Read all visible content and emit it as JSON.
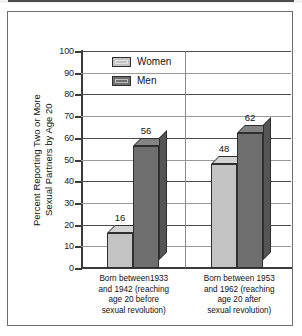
{
  "chart_data": {
    "type": "bar",
    "title": "",
    "xlabel": "",
    "ylabel_line1": "Percent Reporting Two or More",
    "ylabel_line2": "Sexual Partners by Age 20",
    "ylim": [
      0,
      100
    ],
    "ytick_step": 10,
    "yticks": [
      "100",
      "90",
      "80",
      "70",
      "60",
      "50",
      "40",
      "30",
      "20",
      "10",
      "0"
    ],
    "grid": true,
    "legend_position": "top-left-inside",
    "categories": [
      "Born between1933 and 1942 (reaching age 20 before sexual revolution)",
      "Born between 1953 and 1962 (reaching age 20 after sexual revolution)"
    ],
    "category_label_lines": [
      [
        "Born between1933",
        "and 1942 (reaching",
        "age 20 before",
        "sexual revolution)"
      ],
      [
        "Born between 1953",
        "and 1962 (reaching",
        "age 20 after",
        "sexual revolution)"
      ]
    ],
    "series": [
      {
        "name": "Women",
        "color": "#c3c3c3",
        "values": [
          16,
          48
        ]
      },
      {
        "name": "Men",
        "color": "#6f6f6f",
        "values": [
          56,
          62
        ]
      }
    ],
    "data_labels": [
      "16",
      "56",
      "48",
      "62"
    ]
  },
  "legend": {
    "items": [
      {
        "label": "Women",
        "color": "#c3c3c3"
      },
      {
        "label": "Men",
        "color": "#6f6f6f"
      }
    ]
  }
}
